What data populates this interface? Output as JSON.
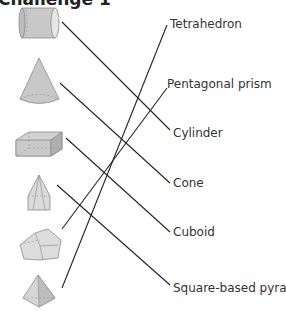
{
  "title": "Challenge 1",
  "shapes": [
    {
      "name": "cylinder"
    },
    {
      "name": "cone"
    },
    {
      "name": "cuboid"
    },
    {
      "name": "square-based-pyramid"
    },
    {
      "name": "pentagonal-prism"
    },
    {
      "name": "tetrahedron"
    }
  ],
  "labels": [
    {
      "text": "Tetrahedron",
      "x": 170,
      "y": 17
    },
    {
      "text": "Pentagonal prism",
      "x": 170,
      "y": 77
    },
    {
      "text": "Cylinder",
      "x": 173,
      "y": 126
    },
    {
      "text": "Cone",
      "x": 173,
      "y": 177
    },
    {
      "text": "Cuboid",
      "x": 173,
      "y": 226
    },
    {
      "text": "Square-based pyramid",
      "x": 173,
      "y": 282
    }
  ],
  "connections": [
    {
      "from": "cylinder",
      "to": "Cylinder"
    },
    {
      "from": "cone",
      "to": "Cone"
    },
    {
      "from": "cuboid",
      "to": "Cuboid"
    },
    {
      "from": "square-based-pyramid",
      "to": "Square-based pyramid"
    },
    {
      "from": "pentagonal-prism",
      "to": "Pentagonal prism"
    },
    {
      "from": "tetrahedron",
      "to": "Tetrahedron"
    }
  ],
  "colors": {
    "line": "#222222",
    "shape_fill": "#cfcfcf",
    "shape_stroke": "#8a8a8a"
  }
}
